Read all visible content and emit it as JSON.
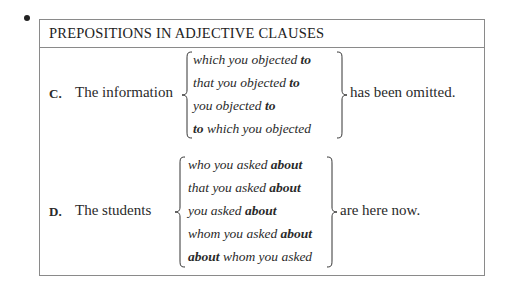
{
  "title": "PREPOSITIONS IN ADJECTIVE CLAUSES",
  "examples": [
    {
      "letter": "C.",
      "lead": "The information",
      "options": [
        {
          "pre": "",
          "bold": "",
          "text": "which you objected ",
          "bold_end": "to"
        },
        {
          "pre": "",
          "bold": "",
          "text": "that you objected ",
          "bold_end": "to"
        },
        {
          "pre": "",
          "bold": "",
          "text": "you objected ",
          "bold_end": "to"
        },
        {
          "pre": "",
          "bold": "to",
          "text": " which you objected",
          "bold_end": ""
        }
      ],
      "tail": "has been omitted."
    },
    {
      "letter": "D.",
      "lead": "The students",
      "options": [
        {
          "bold": "",
          "text": "who you asked ",
          "bold_end": "about"
        },
        {
          "bold": "",
          "text": "that you asked ",
          "bold_end": "about"
        },
        {
          "bold": "",
          "text": "you asked ",
          "bold_end": "about"
        },
        {
          "bold": "",
          "text": "whom you asked ",
          "bold_end": "about"
        },
        {
          "bold": "about",
          "text": " whom you asked",
          "bold_end": ""
        }
      ],
      "tail": "are here now."
    }
  ]
}
